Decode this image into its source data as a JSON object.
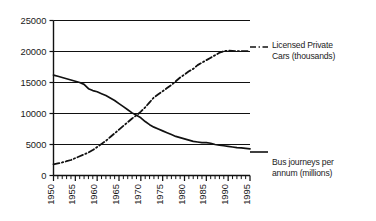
{
  "chart_data": {
    "type": "line",
    "title": "",
    "xlabel": "",
    "ylabel": "",
    "xlim": [
      1950,
      1995
    ],
    "ylim": [
      0,
      25000
    ],
    "grid": true,
    "grid_axis": "y",
    "legend_position": "right",
    "y_ticks": [
      0,
      5000,
      10000,
      15000,
      20000,
      25000
    ],
    "y_tick_labels": [
      "0",
      "5000",
      "10000",
      "15000",
      "20000",
      "25000"
    ],
    "x_ticks": [
      1950,
      1955,
      1960,
      1965,
      1970,
      1975,
      1980,
      1985,
      1990,
      1995
    ],
    "x_tick_labels": [
      "1950",
      "1955",
      "1960",
      "1965",
      "1970",
      "1975",
      "1980",
      "1985",
      "1990",
      "1995"
    ],
    "x_minor_tick_interval": 1,
    "x_tick_label_rotation": -90,
    "series": [
      {
        "name": "Bus journeys per annum (millions)",
        "style": "solid",
        "color": "#111111",
        "x": [
          1950,
          1951,
          1952,
          1953,
          1954,
          1955,
          1956,
          1957,
          1958,
          1959,
          1960,
          1961,
          1962,
          1963,
          1964,
          1965,
          1966,
          1967,
          1968,
          1969,
          1970,
          1971,
          1972,
          1973,
          1974,
          1975,
          1976,
          1977,
          1978,
          1979,
          1980,
          1981,
          1982,
          1983,
          1984,
          1985,
          1986,
          1987,
          1988,
          1989,
          1990,
          1991,
          1992,
          1993,
          1994,
          1995
        ],
        "values": [
          16200,
          16000,
          15800,
          15600,
          15400,
          15200,
          15000,
          14700,
          14000,
          13700,
          13500,
          13200,
          12900,
          12500,
          12100,
          11600,
          11100,
          10600,
          10100,
          9700,
          9300,
          8700,
          8200,
          7800,
          7500,
          7200,
          6900,
          6600,
          6300,
          6100,
          5900,
          5700,
          5500,
          5400,
          5300,
          5300,
          5200,
          5000,
          4900,
          4800,
          4700,
          4600,
          4500,
          4450,
          4380,
          4300
        ]
      },
      {
        "name": "Licensed Private Cars (thousands)",
        "style": "dash-dot",
        "color": "#111111",
        "x": [
          1950,
          1951,
          1952,
          1953,
          1954,
          1955,
          1956,
          1957,
          1958,
          1959,
          1960,
          1961,
          1962,
          1963,
          1964,
          1965,
          1966,
          1967,
          1968,
          1969,
          1970,
          1971,
          1972,
          1973,
          1974,
          1975,
          1976,
          1977,
          1978,
          1979,
          1980,
          1981,
          1982,
          1983,
          1984,
          1985,
          1986,
          1987,
          1988,
          1989,
          1990,
          1991,
          1992,
          1993,
          1994,
          1995
        ],
        "values": [
          1800,
          1950,
          2100,
          2300,
          2500,
          2800,
          3100,
          3400,
          3700,
          4100,
          4600,
          5100,
          5600,
          6200,
          6800,
          7400,
          8000,
          8600,
          9200,
          9700,
          10300,
          11000,
          11800,
          12600,
          13100,
          13600,
          14100,
          14600,
          15200,
          15800,
          16300,
          16800,
          17200,
          17800,
          18200,
          18600,
          19000,
          19400,
          19800,
          20050,
          20150,
          20100,
          20050,
          20050,
          20050,
          20050
        ]
      }
    ]
  },
  "legends": {
    "cars": {
      "line1": "Licensed Private",
      "line2": "Cars (thousands)"
    },
    "bus": {
      "line1": "Bus journeys per",
      "line2": "annum (millions)"
    }
  }
}
